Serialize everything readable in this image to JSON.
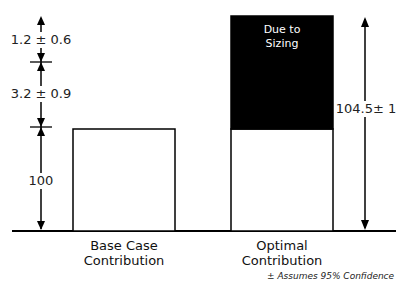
{
  "diagram": {
    "title": "",
    "colors": {
      "line": "#000000",
      "sizing_fill": "#000000",
      "bar_fill": "#ffffff"
    },
    "bars": [
      {
        "name": "base-case",
        "label_line1": "Base Case",
        "label_line2": "Contribution",
        "value": 100
      },
      {
        "name": "optimal",
        "label_line1": "Optimal",
        "label_line2": "Contribution",
        "value": 104.5,
        "segment_label_line1": "Due to",
        "segment_label_line2": "Sizing"
      }
    ],
    "left_dimensions": [
      {
        "label": "1.2 ± 0.6"
      },
      {
        "label": "3.2 ± 0.9"
      },
      {
        "label": "100"
      }
    ],
    "right_dimension": {
      "label": "104.5± 1"
    },
    "footnote": "± Assumes 95% Confidence"
  }
}
